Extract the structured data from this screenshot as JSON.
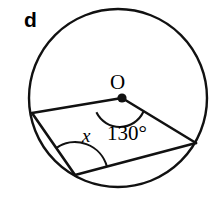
{
  "figure": {
    "part_letter": "d",
    "center_label": "O",
    "angle_x_label": "x",
    "angle_central_label": "130°",
    "stroke_color": "#111111",
    "fill_color": "#ffffff",
    "background_color": "#ffffff"
  },
  "geometry": {
    "circle": {
      "cx": 118,
      "cy": 98,
      "r": 89
    },
    "center_dot": {
      "cx": 122,
      "cy": 98,
      "r": 4.5
    },
    "vertices": {
      "left": {
        "x": 32,
        "y": 113,
        "name": "left-vertex"
      },
      "right": {
        "x": 196,
        "y": 143,
        "name": "right-vertex"
      },
      "bottom": {
        "x": 75,
        "y": 175,
        "name": "bottom-vertex"
      }
    },
    "segments": [
      {
        "name": "radius-to-left-vertex",
        "from": "center",
        "to": "left"
      },
      {
        "name": "radius-to-right-vertex",
        "from": "center",
        "to": "right"
      },
      {
        "name": "chord-left-to-bottom",
        "from": "left",
        "to": "bottom"
      },
      {
        "name": "chord-bottom-to-right",
        "from": "bottom",
        "to": "right"
      }
    ],
    "arcs": {
      "central_angle_arc": {
        "cx": 122,
        "cy": 98,
        "r": 26
      },
      "inscribed_angle_arc": {
        "cx": 75,
        "cy": 175,
        "r": 33
      }
    }
  }
}
